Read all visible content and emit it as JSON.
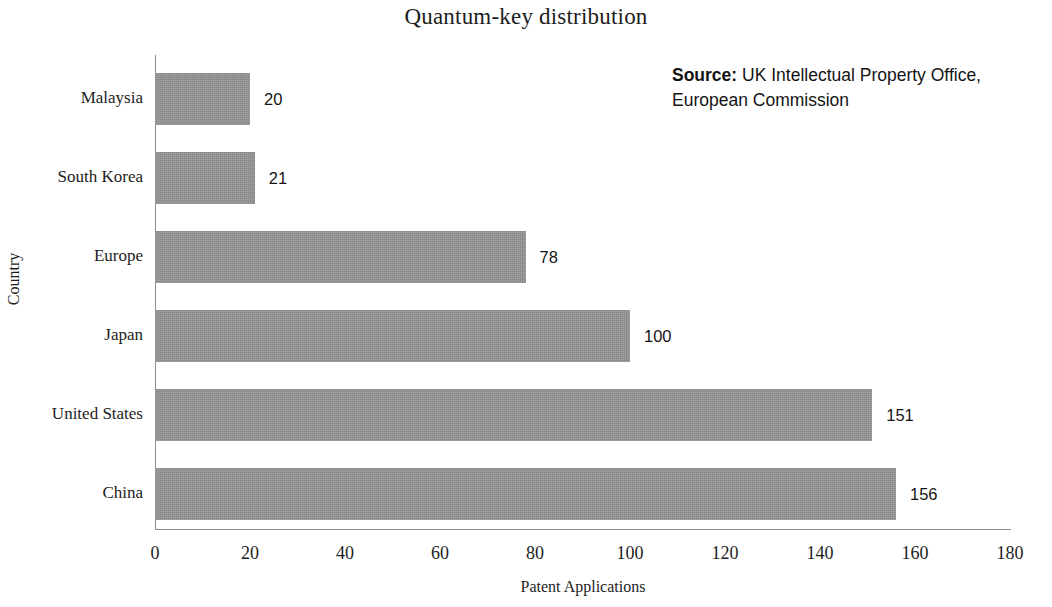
{
  "chart_data": {
    "type": "bar",
    "orientation": "horizontal",
    "title": "Quantum-key distribution",
    "xlabel": "Patent Applications",
    "ylabel": "Country",
    "categories": [
      "Malaysia",
      "South Korea",
      "Europe",
      "Japan",
      "United States",
      "China"
    ],
    "values": [
      20,
      21,
      78,
      100,
      151,
      156
    ],
    "data_labels": [
      "20",
      "21",
      "78",
      "100",
      "151",
      "156"
    ],
    "xlim": [
      0,
      180
    ],
    "xticks": [
      0,
      20,
      40,
      60,
      80,
      100,
      120,
      140,
      160,
      180
    ],
    "xtick_labels": [
      "0",
      "20",
      "40",
      "60",
      "80",
      "100",
      "120",
      "140",
      "160",
      "180"
    ],
    "grid": false,
    "legend": null,
    "bar_color": "#949494",
    "annotations": [
      {
        "name": "source",
        "label": "Source:",
        "text": "UK Intellectual Property Office, European Commission",
        "position": "top-right"
      }
    ]
  },
  "source_note": {
    "label": "Source:",
    "text": "UK Intellectual Property Office, European Commission"
  }
}
